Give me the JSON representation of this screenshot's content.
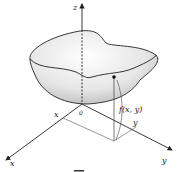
{
  "figure": {
    "axes": {
      "z_label": "z",
      "x_label": "x",
      "y_label": "y",
      "origin_label": "0"
    },
    "annotations": {
      "function_label": "f(x, y)",
      "point_x_label": "x",
      "point_y_label": "y"
    },
    "colors": {
      "stroke": "#222222",
      "surface_light": "#f4f4f4",
      "surface_dark": "#bdbdbd",
      "background": "#ffffff"
    }
  }
}
